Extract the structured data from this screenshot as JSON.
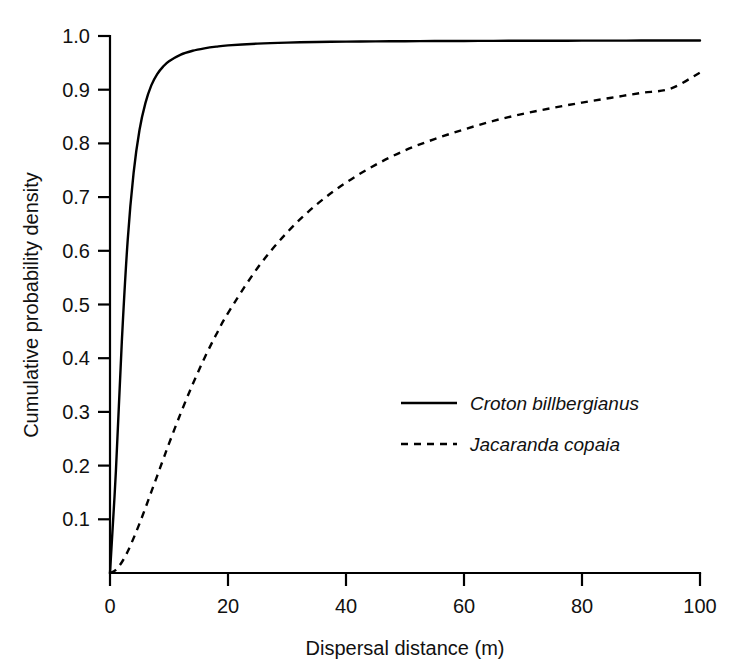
{
  "chart_data": {
    "type": "line",
    "title": "",
    "subtitle": "",
    "xlabel": "Dispersal distance (m)",
    "ylabel": "Cumulative probability density",
    "xlim": [
      0,
      100
    ],
    "ylim": [
      0,
      1.0
    ],
    "grid": false,
    "legend_position": "center-right",
    "xticks": [
      0,
      20,
      40,
      60,
      80,
      100
    ],
    "xtick_labels": [
      "0",
      "20",
      "40",
      "60",
      "80",
      "100"
    ],
    "yticks": [
      0.1,
      0.2,
      0.3,
      0.4,
      0.5,
      0.6,
      0.7,
      0.8,
      0.9,
      1.0
    ],
    "ytick_labels": [
      "0.1",
      "0.2",
      "0.3",
      "0.4",
      "0.5",
      "0.6",
      "0.7",
      "0.8",
      "0.9",
      "1.0"
    ],
    "x": [
      0,
      1,
      2,
      3,
      4,
      5,
      6,
      7,
      8,
      9,
      10,
      12,
      14,
      16,
      18,
      20,
      25,
      30,
      35,
      40,
      45,
      50,
      55,
      60,
      65,
      70,
      75,
      80,
      85,
      90,
      95,
      100
    ],
    "series": [
      {
        "name": "Croton billbergianus",
        "style": "solid",
        "color": "#000000",
        "values": [
          0.0,
          0.19,
          0.43,
          0.62,
          0.745,
          0.825,
          0.875,
          0.908,
          0.929,
          0.943,
          0.953,
          0.9655,
          0.9725,
          0.977,
          0.9802,
          0.9825,
          0.9858,
          0.9877,
          0.9888,
          0.9895,
          0.99,
          0.9903,
          0.9906,
          0.9908,
          0.991,
          0.9911,
          0.9912,
          0.9913,
          0.9914,
          0.9915,
          0.9916,
          0.9917
        ]
      },
      {
        "name": "Jacaranda copaia",
        "style": "dashed",
        "color": "#000000",
        "values": [
          0.0,
          0.006,
          0.02,
          0.04,
          0.065,
          0.092,
          0.121,
          0.151,
          0.181,
          0.211,
          0.241,
          0.298,
          0.351,
          0.4,
          0.444,
          0.484,
          0.568,
          0.634,
          0.686,
          0.727,
          0.76,
          0.787,
          0.808,
          0.826,
          0.842,
          0.855,
          0.866,
          0.876,
          0.885,
          0.894,
          0.902,
          0.932
        ]
      }
    ]
  },
  "legend": {
    "entries": [
      {
        "label": "Croton billbergianus",
        "style": "solid"
      },
      {
        "label": "Jacaranda copaia",
        "style": "dashed"
      }
    ]
  },
  "axes": {
    "x_title": "Dispersal distance (m)",
    "y_title": "Cumulative probability density"
  }
}
